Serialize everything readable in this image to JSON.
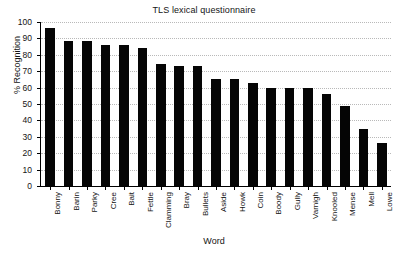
{
  "chart_data": {
    "type": "bar",
    "title": "TLS lexical questionnaire",
    "xlabel": "Word",
    "ylabel": "% Recognition",
    "ylim": [
      0,
      100
    ],
    "ytick_labels": [
      "0",
      "10",
      "20",
      "30",
      "40",
      "50",
      "60",
      "70",
      "80",
      "90",
      "100"
    ],
    "ytick_values": [
      0,
      10,
      20,
      30,
      40,
      50,
      60,
      70,
      80,
      90,
      100
    ],
    "grid": true,
    "legend": false,
    "bar_color": "#050505",
    "categories": [
      "Bonny",
      "Barin",
      "Parky",
      "Cree",
      "Bait",
      "Fettle",
      "Clamming",
      "Bray",
      "Bullets",
      "Aside",
      "Howk",
      "Coin",
      "Boody",
      "Gully",
      "Varnigh",
      "Knooled",
      "Mense",
      "Mell",
      "Lowe"
    ],
    "values": [
      96.5,
      88.5,
      88.5,
      86,
      86,
      84,
      74.5,
      73,
      73,
      65.5,
      65.5,
      63,
      60,
      59.5,
      59.5,
      56,
      49,
      34.5,
      26.5
    ]
  }
}
